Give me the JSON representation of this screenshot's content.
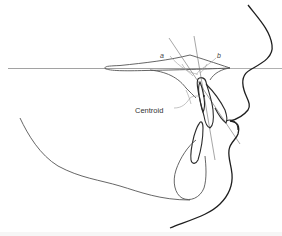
{
  "diagram": {
    "type": "cephalometric-profile-tracing",
    "labels": {
      "angle_a": "a",
      "angle_b": "b",
      "centroid": "Centroid"
    },
    "colors": {
      "background": "#ffffff",
      "reference_line": "#8a8a8a",
      "soft_tissue_profile": "#1e1e1e",
      "bone_outline": "#555555",
      "tooth_outline": "#2a2a2a",
      "construction_lines": "#6a6a6a",
      "label_text": "#333333"
    },
    "elements": [
      "horizontal-reference-line",
      "palatal-plane-outline",
      "upper-incisor-outline",
      "lower-incisor-outline",
      "incisor-long-axis-line",
      "perpendicular-reference-line",
      "angle-a-arc",
      "angle-b-arc",
      "centroid-leader-line",
      "soft-tissue-profile",
      "mandible-outline",
      "symphysis-outline"
    ]
  }
}
